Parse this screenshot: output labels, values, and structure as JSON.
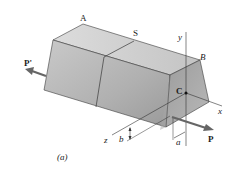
{
  "figure": {
    "caption": "(a)",
    "labels": {
      "A": "A",
      "S": "S",
      "B": "B",
      "C": "C",
      "y": "y",
      "x": "x",
      "z": "z",
      "P": "P",
      "P_prime": "P'",
      "a": "a",
      "b": "b"
    },
    "colors": {
      "face_front": "#b9b9b9",
      "face_top": "#d2d2d2",
      "face_end": "#a9a9a9",
      "edge": "#3a3a3a",
      "arrow": "#6b6b6b",
      "axis": "#333333"
    }
  }
}
